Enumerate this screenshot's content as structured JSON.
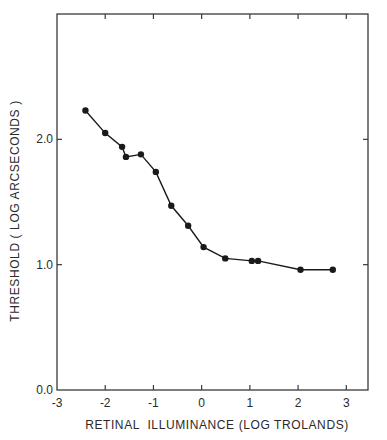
{
  "chart_data": {
    "type": "line",
    "title": "",
    "xlabel": "RETINAL  ILLUMINANCE (LOG TROLANDS)",
    "ylabel": "THRESHOLD ( LOG ARCSECONDS )",
    "xlim": [
      -3,
      3.45
    ],
    "ylim": [
      0,
      3.0
    ],
    "x_ticks": [
      -3,
      -2,
      -1,
      0,
      1,
      2,
      3
    ],
    "x_tick_labels": [
      "-3",
      "-2",
      "-1",
      "0",
      "1",
      "2",
      "3"
    ],
    "y_ticks": [
      0,
      1,
      2
    ],
    "y_tick_labels": [
      "0.0",
      "1.0",
      "2.0"
    ],
    "grid": false,
    "legend": null,
    "series": [
      {
        "name": "threshold",
        "marker": "filled-circle",
        "color": "#1a1a1a",
        "x": [
          -2.41,
          -2.0,
          -1.65,
          -1.57,
          -1.26,
          -0.95,
          -0.63,
          -0.28,
          0.04,
          0.49,
          1.04,
          1.17,
          2.05,
          2.72
        ],
        "y": [
          2.23,
          2.05,
          1.94,
          1.86,
          1.88,
          1.74,
          1.47,
          1.31,
          1.14,
          1.05,
          1.03,
          1.03,
          0.96,
          0.96
        ]
      }
    ]
  },
  "colors": {
    "background": "#ffffff",
    "ink": "#1a1a1a",
    "frame": "#3a3a3a"
  }
}
